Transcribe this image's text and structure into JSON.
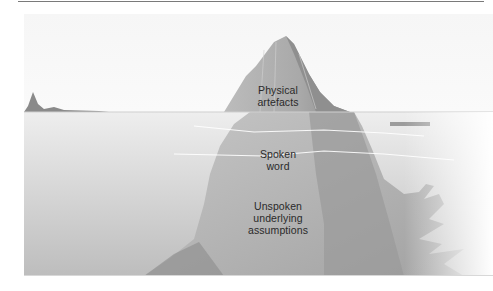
{
  "diagram": {
    "type": "iceberg",
    "layers": [
      {
        "id": "physical",
        "label_line1": "Physical",
        "label_line2": "artefacts",
        "position": "above-water"
      },
      {
        "id": "spoken",
        "label_line1": "Spoken",
        "label_line2": "word",
        "position": "waterline"
      },
      {
        "id": "unspoken",
        "label_line1": "Unspoken",
        "label_line2": "underlying",
        "label_line3": "assumptions",
        "position": "below-water"
      }
    ],
    "colors": {
      "sky": "#f4f4f4",
      "water": "#e6e6e6",
      "ice_light": "#b9b9b9",
      "ice_dark": "#8f8f8f",
      "text": "#2a2a2a"
    }
  }
}
